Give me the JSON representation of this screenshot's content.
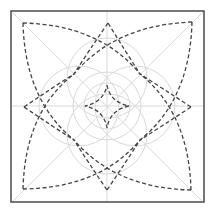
{
  "diagram": {
    "title": "",
    "colors": {
      "frame": "#555555",
      "guides": "#d9d9d9",
      "dashed_outline": "#444444",
      "background": "#ffffff"
    },
    "elements": {
      "frame": "square-frame",
      "guides": [
        "horizontal-axis",
        "vertical-axis",
        "diagonal-1",
        "diagonal-2",
        "inner-circle",
        "middle-circle",
        "petal-circle-top",
        "petal-circle-right",
        "petal-circle-bottom",
        "petal-circle-left"
      ],
      "dashed_shapes": [
        "outer-petal-top",
        "outer-petal-right",
        "outer-petal-bottom",
        "outer-petal-left",
        "corner-petal-top-left",
        "corner-petal-top-right",
        "corner-petal-bottom-right",
        "corner-petal-bottom-left",
        "center-diamond"
      ]
    }
  }
}
